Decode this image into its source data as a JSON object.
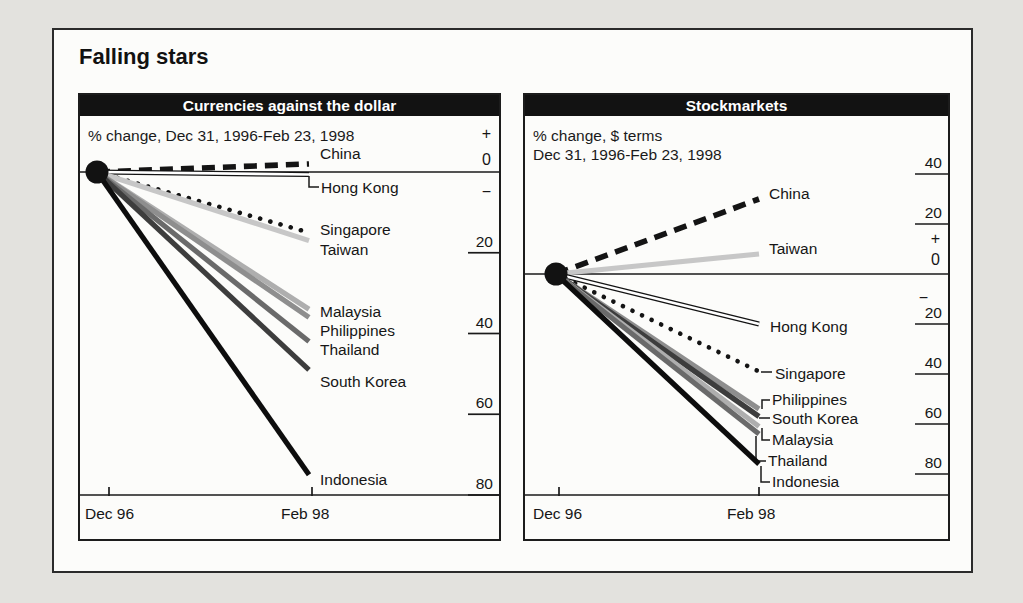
{
  "title": "Falling stars",
  "chart_data": [
    {
      "panel": "currencies",
      "type": "line",
      "title": "Currencies against the dollar",
      "subtitle_lines": [
        "% change, Dec 31, 1996-Feb 23, 1998"
      ],
      "x_ticklabels": [
        "Dec 96",
        "Feb 98"
      ],
      "x_range": [
        "Dec 31, 1996",
        "Feb 23, 1998"
      ],
      "y_axis": {
        "unit": "% change vs dollar",
        "plus_label": "+",
        "zero_label": "0",
        "minus_label": "−",
        "ticks": [
          {
            "value": -20,
            "label": "20"
          },
          {
            "value": -40,
            "label": "40"
          },
          {
            "value": -60,
            "label": "60"
          },
          {
            "value": -80,
            "label": "80"
          }
        ]
      },
      "series": [
        {
          "name": "China",
          "change_pct": 2,
          "style": "dashed",
          "color": "#141414",
          "label_offset": -10
        },
        {
          "name": "Hong Kong",
          "change_pct": 0,
          "style": "double",
          "color": "#141414",
          "label_offset": 13,
          "y_nudge": 2.5,
          "connector": [
            [
              229,
              81
            ],
            [
              229,
              92
            ],
            [
              239,
              92
            ]
          ],
          "label_x": 241
        },
        {
          "name": "Singapore",
          "change_pct": -15,
          "style": "dotted",
          "color": "#141414",
          "label_offset": -3
        },
        {
          "name": "Taiwan",
          "change_pct": -17,
          "style": "solid",
          "color": "#c7c7c7",
          "label_offset": 9
        },
        {
          "name": "Malaysia",
          "change_pct": -34,
          "style": "solid",
          "color": "#aeaeae",
          "label_offset": 3
        },
        {
          "name": "Philippines",
          "change_pct": -36,
          "style": "solid",
          "color": "#8e8e8e",
          "label_offset": 14
        },
        {
          "name": "Thailand",
          "change_pct": -42,
          "style": "solid",
          "color": "#6a6a6a",
          "label_offset": 8
        },
        {
          "name": "South Korea",
          "change_pct": -49,
          "style": "solid",
          "color": "#3d3d3d",
          "label_offset": 12
        },
        {
          "name": "Indonesia",
          "change_pct": -75,
          "style": "solid",
          "color": "#0d0d0d",
          "label_offset": 5
        }
      ]
    },
    {
      "panel": "stockmarkets",
      "type": "line",
      "title": "Stockmarkets",
      "subtitle_lines": [
        "% change, $ terms",
        "Dec 31, 1996-Feb 23, 1998"
      ],
      "x_ticklabels": [
        "Dec 96",
        "Feb 98"
      ],
      "x_range": [
        "Dec 31, 1996",
        "Feb 23, 1998"
      ],
      "y_axis": {
        "unit": "% change, $ terms",
        "plus_label": "+",
        "zero_label": "0",
        "minus_label": "−",
        "ticks": [
          {
            "value": 40,
            "label": "40"
          },
          {
            "value": 20,
            "label": "20"
          },
          {
            "value": -20,
            "label": "20",
            "minus_above": true
          },
          {
            "value": -40,
            "label": "40"
          },
          {
            "value": -60,
            "label": "60"
          },
          {
            "value": -80,
            "label": "80"
          }
        ]
      },
      "series": [
        {
          "name": "China",
          "change_pct": 30,
          "style": "dashed",
          "color": "#141414",
          "label_offset": -5
        },
        {
          "name": "Taiwan",
          "change_pct": 8,
          "style": "solid",
          "color": "#c7c7c7",
          "label_offset": -5
        },
        {
          "name": "Hong Kong",
          "change_pct": -20,
          "style": "double",
          "color": "#141414",
          "label_offset": 3,
          "label_x": 245
        },
        {
          "name": "Singapore",
          "change_pct": -39,
          "style": "dotted",
          "color": "#141414",
          "label_offset": 2,
          "connector": [
            [
              236,
              277
            ],
            [
              247,
              277
            ]
          ],
          "label_x": 250
        },
        {
          "name": "Philippines",
          "change_pct": -54,
          "style": "solid",
          "color": "#8e8e8e",
          "label_offset": -9,
          "connector": [
            [
              237,
              314
            ],
            [
              237,
              305
            ],
            [
              245,
              305
            ]
          ],
          "label_x": 247
        },
        {
          "name": "South Korea",
          "change_pct": -57,
          "style": "solid",
          "color": "#3d3d3d",
          "label_offset": 2,
          "connector": [
            [
              234,
              323
            ],
            [
              245,
              323
            ]
          ],
          "label_x": 247
        },
        {
          "name": "Malaysia",
          "change_pct": -61,
          "style": "solid",
          "color": "#aeaeae",
          "label_offset": 13,
          "connector": [
            [
              237,
              333
            ],
            [
              237,
              345
            ],
            [
              245,
              345
            ]
          ],
          "label_x": 247
        },
        {
          "name": "Thailand",
          "change_pct": -64,
          "style": "solid",
          "color": "#6a6a6a",
          "label_offset": 27,
          "connector": [
            [
              231,
              341
            ],
            [
              231,
              366
            ],
            [
              241,
              366
            ]
          ],
          "label_x": 243
        },
        {
          "name": "Indonesia",
          "change_pct": -76,
          "style": "solid",
          "color": "#0d0d0d",
          "label_offset": 18,
          "connector": [
            [
              236,
              371
            ],
            [
              236,
              387
            ],
            [
              245,
              387
            ]
          ],
          "label_x": 247
        }
      ]
    }
  ],
  "colors": {
    "ink": "#1a1a1a",
    "header_bg": "#121212",
    "header_text": "#ffffff",
    "paper": "#fcfcfa",
    "page_bg": "#e3e2de"
  }
}
